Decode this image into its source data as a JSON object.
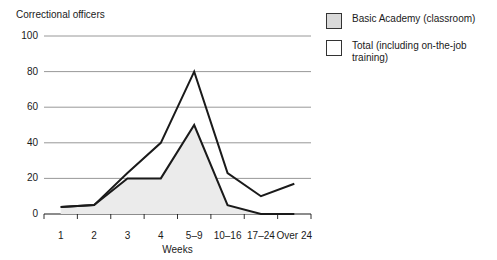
{
  "chart_data": {
    "type": "area",
    "title": "Correctional officers",
    "xlabel": "Weeks",
    "ylabel": "",
    "categories": [
      "1",
      "2",
      "3",
      "4",
      "5–9",
      "10–16",
      "17–24",
      "Over 24"
    ],
    "ylim": [
      0,
      100
    ],
    "yticks": [
      0,
      20,
      40,
      60,
      80,
      100
    ],
    "ytick_labels": [
      "0",
      "20",
      "40",
      "60",
      "80",
      "100"
    ],
    "grid": true,
    "legend_position": "right",
    "series": [
      {
        "name": "Basic Academy (classroom)",
        "fill": "#ebebeb",
        "line_color": "#1a1a1a",
        "filled": true,
        "values": [
          4,
          5,
          20,
          20,
          50,
          5,
          0,
          0
        ]
      },
      {
        "name": "Total (including on-the-job training)",
        "fill": "#ffffff",
        "line_color": "#1a1a1a",
        "filled": false,
        "values": [
          4,
          5,
          23,
          40,
          80,
          23,
          10,
          17
        ]
      }
    ]
  },
  "legend": {
    "items": [
      {
        "label": "Basic Academy (classroom)",
        "swatch_color": "#d9d9d9"
      },
      {
        "label": "Total (including on-the-job training)",
        "swatch_color": "#ffffff"
      }
    ]
  },
  "colors": {
    "gridline": "#8c8c8c",
    "axis": "#1a1a1a",
    "area_fill": "#ebebeb",
    "line": "#1a1a1a",
    "text": "#1a1a1a"
  }
}
